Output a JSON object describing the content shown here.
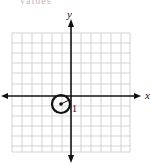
{
  "header": {
    "cropped_text": "values"
  },
  "graph": {
    "y_axis_label": "y",
    "x_axis_label": "x",
    "grid": {
      "columns": 12,
      "rows": 12
    },
    "circle": {
      "center": [
        -1,
        -1
      ],
      "radius": 1,
      "radius_label": "1"
    }
  },
  "colors": {
    "grid": "#c8c8c8",
    "axis": "#111111",
    "circle": "#111111"
  }
}
